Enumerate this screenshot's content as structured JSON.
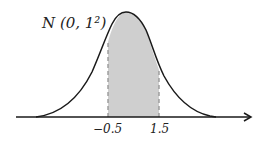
{
  "figure": {
    "distribution_label": "N (0, 1²)",
    "shaded_region": {
      "from": -0.5,
      "to": 1.5,
      "fill": "#cfcfcf"
    },
    "tick_labels": [
      "−0.5",
      "1.5"
    ],
    "colors": {
      "curve": "#1a1a1a",
      "axis": "#1a1a1a",
      "dashed": "#999999",
      "shade": "#cfcfcf"
    }
  }
}
